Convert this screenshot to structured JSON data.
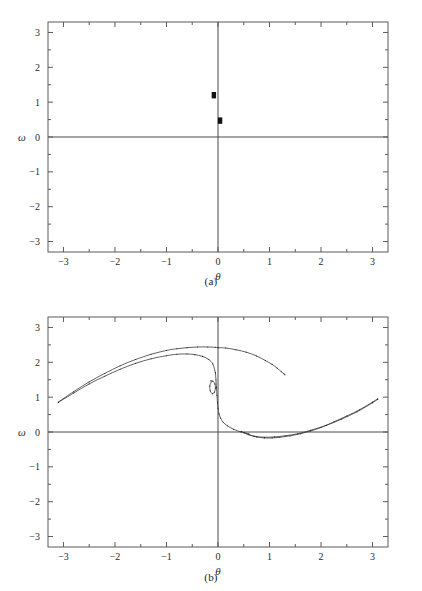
{
  "figure": {
    "panels": [
      {
        "id": "a",
        "caption": "(a)",
        "xlabel": "θ",
        "ylabel": "ω"
      },
      {
        "id": "b",
        "caption": "(b)",
        "xlabel": "θ",
        "ylabel": "ω"
      }
    ]
  },
  "axis": {
    "x_ticks": [
      "-3",
      "-2",
      "-1",
      "0",
      "1",
      "2",
      "3"
    ],
    "y_ticks": [
      "3",
      "2",
      "1",
      "0",
      "-1",
      "-2",
      "-3"
    ]
  },
  "chart_data": [
    {
      "type": "scatter",
      "title": "(a)",
      "xlabel": "θ",
      "ylabel": "ω",
      "xlim": [
        -3.3,
        3.3
      ],
      "ylim": [
        -3.3,
        3.3
      ],
      "x_ticks": [
        -3,
        -2,
        -1,
        0,
        1,
        2,
        3
      ],
      "y_ticks": [
        -3,
        -2,
        -1,
        0,
        1,
        2,
        3
      ],
      "grid": false,
      "legend": "none",
      "annotations": [
        "horizontal zero line at ω = 0",
        "vertical zero line at θ = 0"
      ],
      "series": [
        {
          "name": "poincare-points",
          "x": [
            -0.08,
            0.04
          ],
          "y": [
            1.2,
            0.47
          ]
        }
      ]
    },
    {
      "type": "line",
      "title": "(b)",
      "xlabel": "θ",
      "ylabel": "ω",
      "xlim": [
        -3.3,
        3.3
      ],
      "ylim": [
        -3.3,
        3.3
      ],
      "x_ticks": [
        -3,
        -2,
        -1,
        0,
        1,
        2,
        3
      ],
      "y_ticks": [
        -3,
        -2,
        -1,
        0,
        1,
        2,
        3
      ],
      "grid": false,
      "legend": "none",
      "annotations": [
        "horizontal zero line at ω = 0",
        "vertical zero line at θ = 0",
        "strange attractor / stretched-folded manifold"
      ],
      "series": [
        {
          "name": "upper-left-branch",
          "x": [
            -3.1,
            -2.8,
            -2.5,
            -2.2,
            -1.9,
            -1.6,
            -1.3,
            -1.0,
            -0.8,
            -0.6,
            -0.45,
            -0.3,
            -0.18,
            -0.1,
            -0.05
          ],
          "y": [
            0.85,
            1.12,
            1.38,
            1.6,
            1.8,
            1.97,
            2.1,
            2.19,
            2.23,
            2.24,
            2.22,
            2.17,
            2.08,
            1.95,
            1.7
          ]
        },
        {
          "name": "upper-left-branch-duplicate",
          "x": [
            -3.1,
            -2.8,
            -2.5,
            -2.2,
            -1.9,
            -1.6,
            -1.3,
            -1.0,
            -0.8,
            -0.6,
            -0.4,
            -0.2,
            -0.05,
            0.0
          ],
          "y": [
            0.86,
            1.16,
            1.44,
            1.68,
            1.9,
            2.08,
            2.23,
            2.34,
            2.39,
            2.42,
            2.44,
            2.44,
            2.43,
            2.42
          ]
        },
        {
          "name": "upper-right-branch",
          "x": [
            0.0,
            0.15,
            0.35,
            0.55,
            0.75,
            0.92,
            1.05,
            1.15,
            1.23,
            1.28,
            1.3
          ],
          "y": [
            2.42,
            2.41,
            2.36,
            2.29,
            2.18,
            2.05,
            1.94,
            1.83,
            1.73,
            1.67,
            1.64
          ]
        },
        {
          "name": "central-vertical-drop",
          "x": [
            -0.05,
            -0.04,
            -0.03,
            -0.02,
            -0.01,
            0.0,
            0.02,
            0.05,
            0.1,
            0.18,
            0.3,
            0.45,
            0.6
          ],
          "y": [
            1.7,
            1.5,
            1.28,
            1.05,
            0.85,
            0.68,
            0.52,
            0.4,
            0.28,
            0.18,
            0.08,
            0.0,
            -0.05
          ]
        },
        {
          "name": "inner-hook",
          "x": [
            -0.13,
            -0.16,
            -0.15,
            -0.11,
            -0.07,
            -0.05,
            -0.06,
            -0.1,
            -0.14
          ],
          "y": [
            1.44,
            1.32,
            1.18,
            1.1,
            1.14,
            1.26,
            1.38,
            1.46,
            1.47
          ]
        },
        {
          "name": "lower-branch",
          "x": [
            0.45,
            0.6,
            0.75,
            0.9,
            1.05,
            1.2,
            1.4,
            1.6,
            1.8,
            2.0,
            2.25,
            2.5,
            2.75,
            3.0,
            3.1
          ],
          "y": [
            0.02,
            -0.08,
            -0.14,
            -0.17,
            -0.17,
            -0.15,
            -0.11,
            -0.05,
            0.03,
            0.13,
            0.29,
            0.46,
            0.64,
            0.86,
            0.95
          ]
        },
        {
          "name": "lower-branch-duplicate",
          "x": [
            0.5,
            0.7,
            0.9,
            1.1,
            1.3,
            1.55,
            1.8,
            2.1,
            2.4,
            2.7,
            3.0,
            3.1
          ],
          "y": [
            -0.02,
            -0.12,
            -0.15,
            -0.14,
            -0.11,
            -0.05,
            0.05,
            0.19,
            0.37,
            0.58,
            0.84,
            0.94
          ]
        }
      ]
    }
  ]
}
